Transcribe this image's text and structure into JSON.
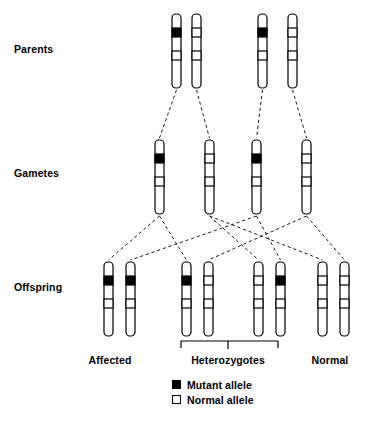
{
  "diagram": {
    "colors": {
      "mutant_allele": "#000000",
      "normal_allele": "#ffffff",
      "outline": "#000000",
      "connector": "#1a1a1a"
    },
    "row_labels": {
      "parents": "Parents",
      "gametes": "Gametes",
      "offspring": "Offspring"
    },
    "group_labels": {
      "affected": "Affected",
      "heterozygotes": "Heterozygotes",
      "normal": "Normal"
    },
    "legend": [
      {
        "icon": "filled-square-icon",
        "swatch": "mutant",
        "label": "Mutant allele"
      },
      {
        "icon": "empty-square-icon",
        "swatch": "normal",
        "label": "Normal allele"
      }
    ],
    "rows": {
      "parents": {
        "label": "Parents",
        "y_top": 14,
        "chromosomes": [
          {
            "id": "p1-left",
            "x": 172,
            "allele": "mutant"
          },
          {
            "id": "p1-right",
            "x": 192,
            "allele": "normal"
          },
          {
            "id": "p2-left",
            "x": 258,
            "allele": "mutant"
          },
          {
            "id": "p2-right",
            "x": 288,
            "allele": "normal"
          }
        ]
      },
      "gametes": {
        "label": "Gametes",
        "y_top": 140,
        "chromosomes": [
          {
            "id": "g1",
            "x": 155,
            "allele": "mutant"
          },
          {
            "id": "g2",
            "x": 205,
            "allele": "normal"
          },
          {
            "id": "g3",
            "x": 252,
            "allele": "mutant"
          },
          {
            "id": "g4",
            "x": 302,
            "allele": "normal"
          }
        ]
      },
      "offspring": {
        "label": "Offspring",
        "y_top": 262,
        "pairs": [
          {
            "id": "o1",
            "phenotype": "Affected",
            "chromosomes": [
              {
                "id": "o1-left",
                "x": 104,
                "allele": "mutant"
              },
              {
                "id": "o1-right",
                "x": 126,
                "allele": "mutant"
              }
            ]
          },
          {
            "id": "o2",
            "phenotype": "Heterozygotes",
            "chromosomes": [
              {
                "id": "o2-left",
                "x": 182,
                "allele": "mutant"
              },
              {
                "id": "o2-right",
                "x": 204,
                "allele": "normal"
              }
            ]
          },
          {
            "id": "o3",
            "phenotype": "Heterozygotes",
            "chromosomes": [
              {
                "id": "o3-left",
                "x": 254,
                "allele": "normal"
              },
              {
                "id": "o3-right",
                "x": 276,
                "allele": "mutant"
              }
            ]
          },
          {
            "id": "o4",
            "phenotype": "Normal",
            "chromosomes": [
              {
                "id": "o4-left",
                "x": 318,
                "allele": "normal"
              },
              {
                "id": "o4-right",
                "x": 340,
                "allele": "normal"
              }
            ]
          }
        ]
      }
    },
    "connectors": {
      "parents_to_gametes": [
        {
          "from": "p1-left",
          "to": "g1"
        },
        {
          "from": "p1-right",
          "to": "g2"
        },
        {
          "from": "p2-left",
          "to": "g3"
        },
        {
          "from": "p2-right",
          "to": "g4"
        }
      ],
      "gametes_to_offspring": [
        {
          "from": "g1",
          "to": "o1-left"
        },
        {
          "from": "g1",
          "to": "o2-left"
        },
        {
          "from": "g2",
          "to": "o3-left"
        },
        {
          "from": "g2",
          "to": "o4-left"
        },
        {
          "from": "g3",
          "to": "o1-right"
        },
        {
          "from": "g3",
          "to": "o3-right"
        },
        {
          "from": "g4",
          "to": "o2-right"
        },
        {
          "from": "g4",
          "to": "o4-right"
        }
      ]
    },
    "bracket": {
      "name": "heterozygotes-bracket",
      "x_start": 181,
      "x_end": 278,
      "y": 341,
      "stem_x": 228
    },
    "chromosome_geometry": {
      "width": 9,
      "height": 74,
      "corner_radius": 4,
      "band_top_y_offset": 14,
      "band_top_height": 9,
      "band_mid_y_offset": 37,
      "band_mid_height": 9
    }
  }
}
